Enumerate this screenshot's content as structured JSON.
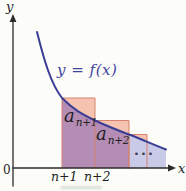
{
  "labels": {
    "curve_equation": "y = f(x)",
    "y_axis": "y",
    "x_axis": "x",
    "origin": "0",
    "tick_n1": "n+1",
    "tick_n2": "n+2",
    "term1_base": "a",
    "term1_sub": "n+1",
    "term2_base": "a",
    "term2_sub": "n+2",
    "ellipsis": "..."
  },
  "colors": {
    "background": "#fcfcf8",
    "curve": "#3a3d95",
    "curve_label": "#4043a2",
    "axis": "#2d2b2b",
    "text": "#221f1f",
    "region_under_curve": "#c9cae7",
    "region_overlap": "#b48cb4",
    "rect_above_curve": "#f6c3b0",
    "rect_border": "#d6826f"
  },
  "geometry": {
    "canvas": {
      "width": 186,
      "height": 191
    },
    "paths": [
      {
        "name": "region-under-curve",
        "d": "M 62 98 C 74 110 82 114 95 120.5 C 107 126 117 130 129 134.5 C 141 139 153 144.5 166 149.5 L 166 168 L 62 168 Z",
        "fill": "region_under_curve"
      },
      {
        "name": "region-rect-overlap",
        "d": "M 62 98 C 74 110 82 114 95 120.5 C 107 126 117 130 129 134.5 L 129 168 L 62 168 Z",
        "fill": "region_overlap"
      },
      {
        "name": "rect1-above-curve",
        "d": "M 62 98 L 95 98 L 95 120.5 C 82 114 74 110 62 98 Z",
        "fill": "rect_above_curve"
      },
      {
        "name": "rect2-above-curve",
        "d": "M 95 120.5 L 129 120.5 L 129 134.5 C 117 130 107 126 95 120.5 Z",
        "fill": "rect_above_curve"
      },
      {
        "name": "rect3-above-curve",
        "d": "M 129 134.5 L 147 134.5 L 147 141.8 C 141 139.3 135 136.8 129 134.5 Z",
        "fill": "rect_above_curve"
      },
      {
        "name": "rect1-border",
        "d": "M 62 168 L 62 98 L 95 98 L 95 168",
        "stroke": "rect_border",
        "width": 1
      },
      {
        "name": "rect2-border",
        "d": "M 95 120.5 L 129 120.5 L 129 168",
        "stroke": "rect_border",
        "width": 1
      },
      {
        "name": "rect3-border",
        "d": "M 129 168 L 129 134.5 L 147 134.5 L 147 168",
        "stroke": "rect_border",
        "width": 1
      },
      {
        "name": "function-curve",
        "d": "M 37 32 C 44 60 51 84 62 98 C 74 110 82 114 95 120.5 C 107 126 117 130 129 134.5 C 141 139 153 144.5 166 149.5",
        "stroke": "curve",
        "width": 2
      },
      {
        "name": "x-axis-line",
        "d": "M 13 168 L 169 168",
        "stroke": "axis",
        "width": 1.3
      },
      {
        "name": "y-axis-line",
        "d": "M 13 21 L 13 186",
        "stroke": "axis",
        "width": 1.3
      },
      {
        "name": "x-axis-arrowhead",
        "d": "M 176 168 L 168 164.6 L 168 171.4 Z",
        "fill": "axis"
      },
      {
        "name": "y-axis-arrowhead",
        "d": "M 13 14 L 9.6 22 L 16.4 22 Z",
        "fill": "axis"
      }
    ]
  }
}
